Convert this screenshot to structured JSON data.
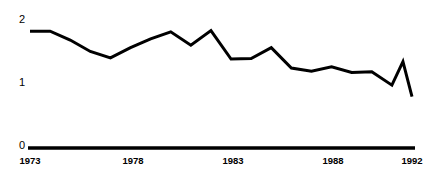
{
  "chart_data": {
    "type": "line",
    "title": "",
    "subtitle": "",
    "xlabel": "",
    "ylabel": "",
    "x": [
      1973,
      1974,
      1975,
      1976,
      1977,
      1978,
      1979,
      1980,
      1981,
      1982,
      1983,
      1984,
      1985,
      1986,
      1987,
      1988,
      1989,
      1990,
      1991,
      1992
    ],
    "values": [
      1.84,
      1.84,
      1.7,
      1.52,
      1.42,
      1.58,
      1.72,
      1.83,
      1.62,
      1.85,
      1.4,
      1.41,
      1.58,
      1.26,
      1.21,
      1.28,
      1.19,
      1.2,
      0.99,
      0.81
    ],
    "series": [
      {
        "name": "series-1",
        "values": [
          1.84,
          1.84,
          1.7,
          1.52,
          1.42,
          1.58,
          1.72,
          1.83,
          1.62,
          1.85,
          1.4,
          1.41,
          1.58,
          1.26,
          1.21,
          1.28,
          1.19,
          1.2,
          0.99,
          0.81
        ]
      }
    ],
    "annotations": [
      {
        "label": "1991 local peak before final drop",
        "x": 1991,
        "y": 1.36
      }
    ],
    "xlim": [
      1973,
      1992
    ],
    "ylim": [
      0,
      2
    ],
    "y_ticks": [
      0,
      1,
      2
    ],
    "y_tick_labels": [
      "0",
      "1",
      "2"
    ],
    "x_ticks": [
      1973,
      1978,
      1983,
      1988,
      1992
    ],
    "x_tick_labels": [
      "1973",
      "1978",
      "1983",
      "1988",
      "1992"
    ],
    "grid": false,
    "legend": false,
    "legend_position": "none",
    "line_color": "#000000",
    "axis_color": "#000000",
    "background_color": "#ffffff",
    "line_width": 3,
    "axis_width": 3.5
  },
  "axes": {
    "y_labels": {
      "top": "2",
      "middle": "1",
      "bottom": "0"
    },
    "x_labels": {
      "start": "1973",
      "second": "1978",
      "third": "1983",
      "fourth": "1988",
      "end": "1992"
    }
  }
}
